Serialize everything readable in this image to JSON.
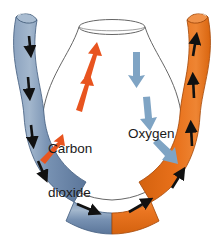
{
  "diagram": {
    "background_color": "#ffffff",
    "width": 224,
    "height": 238,
    "labels": {
      "carbon_dioxide": "Carbon\ndioxide",
      "carbon_dioxide_line1": "Carbon",
      "carbon_dioxide_line2": "dioxide",
      "oxygen": "Oxygen"
    },
    "colors": {
      "deoxygenated_tube": "#6f8bad",
      "deoxygenated_tube_shade": "#5c779a",
      "deoxygenated_tube_highlight": "#9fb3cb",
      "oxygenated_tube": "#e8701a",
      "oxygenated_tube_shade": "#cf5f10",
      "oxygenated_tube_highlight": "#f29a55",
      "chamber_fill": "#ffffff",
      "chamber_outline": "#4a4a4a",
      "flow_arrow": "#111111",
      "co2_arrow": "#e8541f",
      "o2_arrow": "#7fa4c4",
      "label_text": "#1a1a1a"
    },
    "elements": {
      "left_tube_name": "deoxygenated-blood-tube",
      "right_tube_name": "oxygenated-blood-tube",
      "chamber_name": "gas-exchange-chamber",
      "left_tube_description": "Blue-grey tube on the left carrying flow downward",
      "right_tube_description": "Orange tube on the right carrying flow upward",
      "chamber_description": "White vase-shaped chamber between the tubes"
    },
    "flow_arrows": {
      "left_tube_direction": "down",
      "right_tube_direction": "up",
      "bottom_direction": "left-to-right",
      "left_tube_count": 5,
      "right_tube_count": 4,
      "bottom_left_count": 1,
      "bottom_right_count": 1
    },
    "gas_arrows": {
      "co2_direction": "up-right into chamber",
      "co2_count": 3,
      "o2_direction": "down-right out of chamber",
      "o2_count": 3
    }
  }
}
